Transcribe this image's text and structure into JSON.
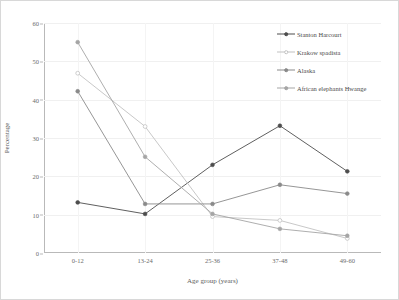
{
  "chart_data": {
    "type": "line",
    "title": "",
    "xlabel": "Age group (years)",
    "ylabel": "Percentage",
    "categories": [
      "0-12",
      "13-24",
      "25-36",
      "37-48",
      "49-60"
    ],
    "ylim": [
      0,
      60
    ],
    "yticks": [
      0,
      10,
      20,
      30,
      40,
      50,
      60
    ],
    "grid": true,
    "legend_position": "top-right",
    "series": [
      {
        "name": "Stanton Harcourt",
        "values": [
          13.2,
          10.2,
          23.0,
          33.2,
          21.3
        ],
        "color": "#4d4d4d",
        "marker": "filled-circle"
      },
      {
        "name": "Krakow spadista",
        "values": [
          46.9,
          33.0,
          9.5,
          8.5,
          3.8
        ],
        "color": "#c2c2c2",
        "marker": "open-circle"
      },
      {
        "name": "Alaska",
        "values": [
          42.2,
          12.8,
          12.8,
          17.8,
          15.5
        ],
        "color": "#8a8a8a",
        "marker": "filled-circle"
      },
      {
        "name": "African elephants Hwange",
        "values": [
          55.0,
          25.1,
          10.2,
          6.3,
          4.5
        ],
        "color": "#a5a5a5",
        "marker": "filled-circle"
      }
    ]
  },
  "figure": {
    "background": "#ffffff",
    "frame_color": "#d8d8d8",
    "axis_color": "#b9b9b9",
    "grid_color": "#f0f0f0",
    "text_color": "#4a4a4a"
  }
}
